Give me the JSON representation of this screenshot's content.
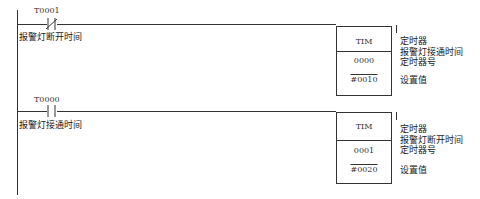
{
  "rungs": [
    {
      "contact": {
        "address": "T0001",
        "type": "normally-closed",
        "symbol": "/"
      },
      "contact_comment": "报警灯断开时间",
      "instruction": {
        "name": "TIM",
        "timer_number": "0000",
        "set_value": "#0010"
      },
      "notes": {
        "instr": "定时器",
        "comment": "报警灯接通时间",
        "timer_no": "定时器号",
        "sv": "设置值"
      }
    },
    {
      "contact": {
        "address": "T0000",
        "type": "normally-open",
        "symbol": ""
      },
      "contact_comment": "报警灯接通时间",
      "instruction": {
        "name": "TIM",
        "timer_number": "0001",
        "set_value": "#0020"
      },
      "notes": {
        "instr": "定时器",
        "comment": "报警灯断开时间",
        "timer_no": "定时器号",
        "sv": "设置值"
      }
    }
  ]
}
